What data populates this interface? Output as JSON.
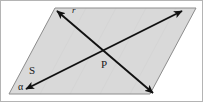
{
  "figure": {
    "canvas": {
      "width": 203,
      "height": 102
    },
    "colors": {
      "background": "#ffffff",
      "frame_border": "#b4b4b4",
      "plane_fill": "#d9d9d9",
      "plane_stroke": "#8c8c8c",
      "line_stroke": "#111111",
      "label_color": "#1a1a1a"
    },
    "plane": {
      "name": "alpha",
      "label": "α",
      "label_x": 22,
      "label_y": 90,
      "shape": "parallelogram",
      "points": "55,8 196,8 150,94 9,94"
    },
    "lines": [
      {
        "id": "line-r",
        "label": "r",
        "label_x": 72,
        "label_y": 13,
        "arrowheads": "both",
        "from_x": 57,
        "from_y": 11,
        "to_x": 153,
        "to_y": 93
      },
      {
        "id": "line-s",
        "label": "S",
        "label_x": 29,
        "label_y": 74,
        "arrowheads": "both",
        "from_x": 26,
        "from_y": 89,
        "to_x": 182,
        "to_y": 11
      }
    ],
    "points": [
      {
        "id": "point-P",
        "label": "P",
        "label_x": 101,
        "label_y": 68,
        "x": 104,
        "y": 58
      }
    ]
  }
}
